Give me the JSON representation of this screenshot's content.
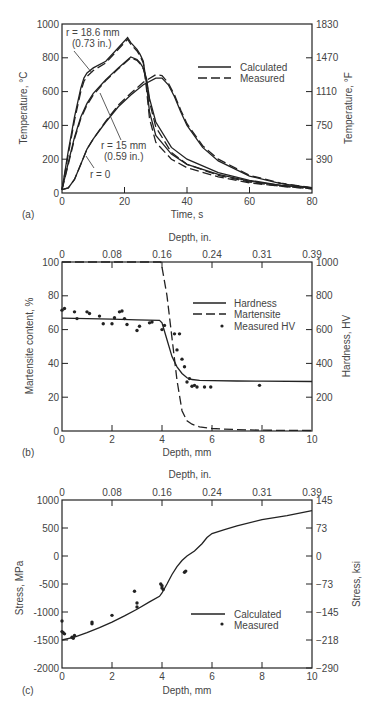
{
  "chart_data": [
    {
      "id": "a",
      "panel_label": "(a)",
      "type": "line",
      "xlabel": "Time, s",
      "ylabel": "Temperature, °C",
      "ylabel_right": "Temperature, °F",
      "xlim": [
        0,
        80
      ],
      "ylim": [
        0,
        1000
      ],
      "xticks": [
        "0",
        "20",
        "40",
        "60",
        "80"
      ],
      "xtick_values": [
        0,
        20,
        40,
        60,
        80
      ],
      "yticks": [
        "0",
        "200",
        "400",
        "600",
        "800",
        "1000"
      ],
      "ytick_values": [
        0,
        200,
        400,
        600,
        800,
        1000
      ],
      "yticks_right": [
        "390",
        "750",
        "1110",
        "1470",
        "1830"
      ],
      "ytick_right_values": [
        200,
        400,
        600,
        800,
        1000
      ],
      "legend": {
        "placement": "top-right",
        "entries": [
          {
            "label": "Calculated",
            "style": "solid"
          },
          {
            "label": "Measured",
            "style": "dashed"
          }
        ]
      },
      "annotations": [
        {
          "text": "r = 18.6 mm",
          "line2": "(0.73 in.)"
        },
        {
          "text": "r = 15 mm",
          "line2": "(0.59 in.)"
        },
        {
          "text": "r = 0",
          "line2": ""
        }
      ],
      "series": [
        {
          "name": "r = 18.6 mm Calculated",
          "style": "solid",
          "x": [
            0,
            2,
            4,
            6,
            7,
            8,
            10,
            14,
            18,
            21,
            22,
            24,
            25,
            26,
            27,
            28,
            30,
            35,
            40,
            50,
            60,
            70,
            80
          ],
          "y": [
            20,
            250,
            450,
            620,
            680,
            710,
            740,
            780,
            860,
            920,
            890,
            850,
            820,
            780,
            650,
            480,
            340,
            230,
            170,
            110,
            70,
            45,
            30
          ]
        },
        {
          "name": "r = 18.6 mm Measured",
          "style": "dashed",
          "x": [
            0,
            2,
            4,
            6,
            7,
            8,
            10,
            14,
            18,
            21,
            22,
            24,
            25,
            26,
            27,
            28,
            30,
            35,
            40,
            50,
            60,
            70,
            80
          ],
          "y": [
            20,
            230,
            430,
            600,
            660,
            690,
            725,
            770,
            850,
            910,
            880,
            840,
            810,
            770,
            620,
            440,
            300,
            200,
            150,
            95,
            60,
            40,
            25
          ]
        },
        {
          "name": "r = 15 mm Calculated",
          "style": "solid",
          "x": [
            0,
            2,
            4,
            6,
            8,
            10,
            14,
            18,
            22,
            24,
            25,
            26,
            27,
            28,
            30,
            35,
            40,
            50,
            60,
            70,
            80
          ],
          "y": [
            20,
            180,
            330,
            450,
            530,
            590,
            670,
            740,
            805,
            790,
            770,
            740,
            680,
            560,
            420,
            270,
            200,
            120,
            75,
            45,
            30
          ]
        },
        {
          "name": "r = 15 mm Measured",
          "style": "dashed",
          "x": [
            0,
            2,
            4,
            6,
            8,
            10,
            14,
            18,
            22,
            24,
            25,
            26,
            27,
            28,
            30,
            35,
            40,
            50,
            60,
            70,
            80
          ],
          "y": [
            20,
            170,
            320,
            440,
            520,
            580,
            665,
            735,
            800,
            785,
            765,
            735,
            670,
            540,
            390,
            240,
            170,
            105,
            65,
            40,
            25
          ]
        },
        {
          "name": "r = 0 Calculated",
          "style": "solid",
          "x": [
            0,
            2,
            4,
            6,
            8,
            10,
            14,
            18,
            22,
            26,
            30,
            32,
            34,
            36,
            38,
            40,
            45,
            50,
            60,
            70,
            80
          ],
          "y": [
            20,
            30,
            80,
            170,
            260,
            320,
            420,
            510,
            580,
            640,
            680,
            680,
            640,
            570,
            480,
            400,
            270,
            190,
            100,
            55,
            30
          ]
        },
        {
          "name": "r = 0 Measured",
          "style": "dashed",
          "x": [
            0,
            2,
            4,
            6,
            8,
            10,
            14,
            18,
            22,
            26,
            30,
            32,
            34,
            36,
            38,
            40,
            45,
            50,
            60,
            70,
            80
          ],
          "y": [
            20,
            30,
            80,
            170,
            260,
            320,
            425,
            520,
            590,
            655,
            700,
            695,
            650,
            580,
            490,
            410,
            280,
            200,
            105,
            58,
            32
          ]
        }
      ]
    },
    {
      "id": "b",
      "panel_label": "(b)",
      "type": "line",
      "title_top": "Depth, in.",
      "xlabel": "Depth, mm",
      "ylabel": "Martensite content, %",
      "ylabel_right": "Hardness, HV",
      "xlim": [
        0,
        10
      ],
      "ylim": [
        0,
        100
      ],
      "ylim_right": [
        0,
        1000
      ],
      "xticks": [
        "0",
        "2",
        "4",
        "6",
        "8",
        "10"
      ],
      "xtick_values": [
        0,
        2,
        4,
        6,
        8,
        10
      ],
      "xticks_top": [
        "0",
        "0.08",
        "0.16",
        "0.24",
        "0.31",
        "0.39"
      ],
      "xtick_top_values": [
        0,
        2,
        4,
        6,
        8,
        10
      ],
      "yticks": [
        "0",
        "20",
        "40",
        "60",
        "80",
        "100"
      ],
      "ytick_values": [
        0,
        20,
        40,
        60,
        80,
        100
      ],
      "yticks_right": [
        "200",
        "400",
        "600",
        "800",
        "1000"
      ],
      "ytick_right_values": [
        20,
        40,
        60,
        80,
        100
      ],
      "legend": {
        "placement": "center-right",
        "entries": [
          {
            "label": "Hardness",
            "style": "solid"
          },
          {
            "label": "Martensite",
            "style": "dashed"
          },
          {
            "label": "Measured HV",
            "style": "marker"
          }
        ]
      },
      "series": [
        {
          "name": "Hardness",
          "style": "solid",
          "axis": "right",
          "x": [
            0,
            1,
            2,
            3,
            3.9,
            4.0,
            4.2,
            4.4,
            4.6,
            4.8,
            5.0,
            5.2,
            5.5,
            6,
            7,
            8,
            10
          ],
          "y": [
            668,
            665,
            662,
            658,
            655,
            640,
            540,
            440,
            380,
            340,
            315,
            305,
            300,
            298,
            296,
            295,
            293
          ]
        },
        {
          "name": "Martensite",
          "style": "dashed",
          "axis": "left",
          "x": [
            0,
            1,
            2,
            3,
            3.95,
            4.0,
            4.2,
            4.4,
            4.6,
            4.8,
            5.0,
            5.2,
            5.5,
            6,
            7,
            8,
            10
          ],
          "y": [
            100,
            100,
            100,
            100,
            100,
            97,
            80,
            55,
            30,
            12,
            6,
            4,
            2.5,
            1.5,
            0.8,
            0.5,
            0.3
          ]
        },
        {
          "name": "Measured HV",
          "style": "marker",
          "axis": "right",
          "x": [
            0,
            0.1,
            0.5,
            0.6,
            1.0,
            1.1,
            1.5,
            1.65,
            2.0,
            2.1,
            2.3,
            2.4,
            2.5,
            2.6,
            3.0,
            3.1,
            3.5,
            3.6,
            4.0,
            4.1,
            4.5,
            4.6,
            4.7,
            4.8,
            4.9,
            5.0,
            5.1,
            5.2,
            5.3,
            5.4,
            5.7,
            5.95,
            7.9
          ],
          "y": [
            715,
            725,
            705,
            665,
            705,
            695,
            680,
            635,
            635,
            670,
            705,
            710,
            665,
            630,
            595,
            620,
            640,
            645,
            600,
            625,
            575,
            480,
            575,
            425,
            380,
            290,
            310,
            265,
            270,
            260,
            260,
            260,
            270
          ]
        }
      ]
    },
    {
      "id": "c",
      "panel_label": "(c)",
      "type": "line",
      "title_top": "Depth, in.",
      "xlabel": "Depth, mm",
      "ylabel": "Stress, MPa",
      "ylabel_right": "Stress, ksi",
      "xlim": [
        0,
        10
      ],
      "ylim": [
        -2000,
        1000
      ],
      "xticks": [
        "0",
        "2",
        "4",
        "6",
        "8",
        "10"
      ],
      "xtick_values": [
        0,
        2,
        4,
        6,
        8,
        10
      ],
      "xticks_top": [
        "0",
        "0.08",
        "0.16",
        "0.24",
        "0.31",
        "0.39"
      ],
      "xtick_top_values": [
        0,
        2,
        4,
        6,
        8,
        10
      ],
      "yticks": [
        "-2000",
        "-1500",
        "-1000",
        "-500",
        "0",
        "500",
        "1000"
      ],
      "ytick_values": [
        -2000,
        -1500,
        -1000,
        -500,
        0,
        500,
        1000
      ],
      "yticks_right": [
        "−290",
        "−218",
        "−145",
        "−73",
        "0",
        "73",
        "145"
      ],
      "ytick_right_values": [
        -2000,
        -1500,
        -1000,
        -500,
        0,
        500,
        1000
      ],
      "legend": {
        "placement": "bottom-right",
        "entries": [
          {
            "label": "Calculated",
            "style": "solid"
          },
          {
            "label": "Measured",
            "style": "marker"
          }
        ]
      },
      "series": [
        {
          "name": "Calculated",
          "style": "solid",
          "x": [
            0,
            0.5,
            1,
            1.5,
            2,
            2.5,
            3,
            3.5,
            3.9,
            4.0,
            4.2,
            4.4,
            4.6,
            4.8,
            5.0,
            5.3,
            5.6,
            5.8,
            6,
            6.5,
            7,
            8,
            9,
            10
          ],
          "y": [
            -1500,
            -1450,
            -1370,
            -1280,
            -1180,
            -1070,
            -950,
            -820,
            -720,
            -660,
            -500,
            -330,
            -190,
            -80,
            0,
            90,
            220,
            330,
            400,
            470,
            540,
            650,
            720,
            810
          ]
        },
        {
          "name": "Measured",
          "style": "marker",
          "x": [
            0,
            0,
            0.05,
            0.1,
            0.4,
            0.45,
            0.5,
            1.2,
            1.2,
            2.0,
            2.9,
            3.0,
            3.0,
            3.95,
            4.0,
            4.0,
            4.05,
            4.9,
            4.95
          ],
          "y": [
            -1160,
            -1350,
            -1370,
            -1390,
            -1450,
            -1470,
            -1420,
            -1180,
            -1210,
            -1060,
            -630,
            -840,
            -910,
            -500,
            -530,
            -570,
            -600,
            -290,
            -270
          ]
        }
      ]
    }
  ]
}
